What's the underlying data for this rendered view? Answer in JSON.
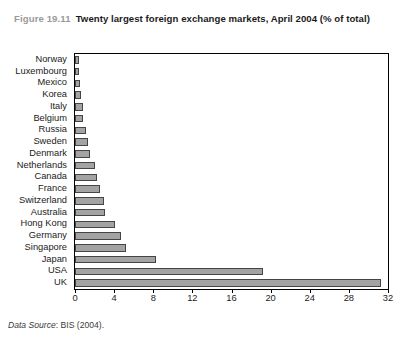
{
  "figure": {
    "label": "Figure 19.11",
    "title": "Twenty largest foreign exchange markets, April 2004 (% of total)",
    "source_prefix": "Data Source",
    "source_text": ": BIS (2004)."
  },
  "colors": {
    "bar_fill": "#a3a3a3",
    "bar_stroke": "#454545",
    "frame": "#000000",
    "label_gray": "#9a9a9a",
    "text": "#1b1b1b"
  },
  "chart_data": {
    "type": "bar",
    "orientation": "horizontal",
    "title": "Twenty largest foreign exchange markets, April 2004 (% of total)",
    "xlabel": "",
    "ylabel": "",
    "xlim": [
      0,
      32
    ],
    "xticks": [
      0,
      4,
      8,
      12,
      16,
      20,
      24,
      28,
      32
    ],
    "grid": false,
    "legend": false,
    "categories": [
      "Norway",
      "Luxembourg",
      "Mexico",
      "Korea",
      "Italy",
      "Belgium",
      "Russia",
      "Sweden",
      "Denmark",
      "Netherlands",
      "Canada",
      "France",
      "Switzerland",
      "Australia",
      "Hong Kong",
      "Germany",
      "Singapore",
      "Japan",
      "USA",
      "UK"
    ],
    "values": [
      0.4,
      0.4,
      0.5,
      0.6,
      0.8,
      0.8,
      1.1,
      1.3,
      1.5,
      2.0,
      2.2,
      2.6,
      3.0,
      3.1,
      4.1,
      4.7,
      5.2,
      8.3,
      19.2,
      31.3
    ]
  }
}
